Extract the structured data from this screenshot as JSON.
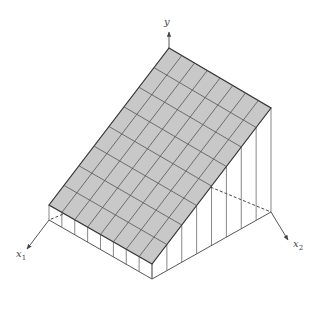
{
  "diagram": {
    "type": "3d-surface-wedge",
    "axes": {
      "y": {
        "label": "y"
      },
      "x1": {
        "label": "x",
        "sub": "1"
      },
      "x2": {
        "label": "x",
        "sub": "2"
      }
    },
    "grid": {
      "rows": 8,
      "cols": 8
    },
    "colors": {
      "surface_fill": "#c8c8c8",
      "grid_line": "#555555",
      "edge": "#333333",
      "axis": "#444444",
      "background": "#ffffff"
    }
  }
}
